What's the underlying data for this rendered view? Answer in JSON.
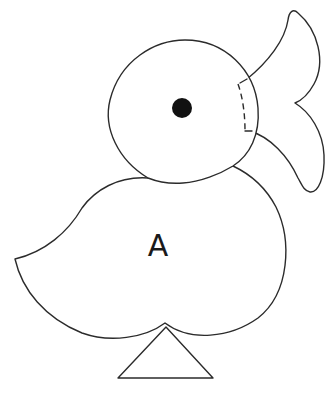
{
  "diagram": {
    "body_label": "A",
    "colors": {
      "line": "#2b2b2b",
      "fill": "#ffffff",
      "eye": "#111111",
      "label": "#1a1a1a"
    },
    "parts": [
      {
        "name": "head",
        "shape": "circle"
      },
      {
        "name": "eye",
        "shape": "filled-dot"
      },
      {
        "name": "beak",
        "shape": "two-lobed"
      },
      {
        "name": "beak-fold-line",
        "style": "dashed"
      },
      {
        "name": "body",
        "shape": "rounded-with-tail",
        "label": "A"
      },
      {
        "name": "stand",
        "shape": "triangle"
      }
    ]
  }
}
